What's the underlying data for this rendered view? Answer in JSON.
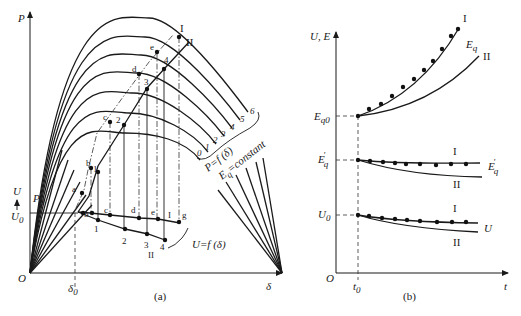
{
  "figure_a": {
    "caption": "(a)",
    "y_axis_label": "P",
    "x_axis_label": "δ",
    "origin_label": "O",
    "delta0_label": "δ",
    "delta0_sub": "0",
    "p0_label": "P",
    "p0_sub": "0",
    "u_axis_label": "U",
    "u0_label": "U",
    "u0_sub": "0",
    "power_curve_numbers": [
      "0",
      "1",
      "2",
      "3",
      "4",
      "5",
      "6"
    ],
    "power_family_label": "P=f (δ)",
    "eq_constant_label": "E",
    "eq_constant_sub": "q",
    "eq_constant_suffix": "=constant",
    "voltage_family_label": "U=f (δ)",
    "trajectory_I_points": [
      "a",
      "b",
      "c",
      "d",
      "e",
      "I"
    ],
    "trajectory_II_points": [
      "1",
      "2",
      "3",
      "4",
      "II"
    ],
    "voltage_I_points": [
      "b",
      "c",
      "d",
      "e",
      "g"
    ],
    "voltage_II_points": [
      "1",
      "2",
      "3",
      "4"
    ],
    "curve_I_label": "I",
    "curve_II_label": "II"
  },
  "figure_b": {
    "caption": "(b)",
    "y_axis_label": "U, E",
    "x_axis_label": "t",
    "origin_label": "O",
    "t0_label": "t",
    "t0_sub": "0",
    "eq0_label": "E",
    "eq0_sub": "q0",
    "eqp_label": "E",
    "eqp_sub": "q",
    "eqp_prime": "′",
    "u0_label": "U",
    "u0_sub": "0",
    "curves": [
      {
        "name": "Eq",
        "label": "E",
        "sub": "q",
        "case_I": "I",
        "case_II": "II"
      },
      {
        "name": "Eq'",
        "label": "E",
        "sub": "q",
        "prime": "′",
        "case_I": "I",
        "case_II": "II"
      },
      {
        "name": "U",
        "label": "U",
        "case_I": "I",
        "case_II": "II"
      }
    ]
  }
}
